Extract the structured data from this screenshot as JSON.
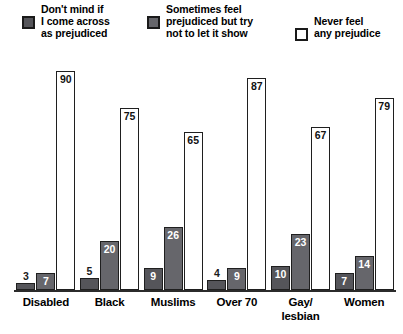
{
  "chart_data": {
    "type": "bar",
    "title": "",
    "subtitle": "",
    "xlabel": "",
    "ylabel": "",
    "ylim": [
      0,
      95
    ],
    "grid": false,
    "legend_position": "top",
    "categories": [
      "Disabled",
      "Black",
      "Muslims",
      "Over 70",
      "Gay/\nlesbian",
      "Women"
    ],
    "series": [
      {
        "name": "Don't mind if\nI come across\nas prejudiced",
        "color": "#55555a",
        "values": [
          3,
          5,
          9,
          4,
          10,
          7
        ]
      },
      {
        "name": "Sometimes feel\nprejudiced but try\nnot to let it show",
        "color": "#66666b",
        "values": [
          7,
          20,
          26,
          9,
          23,
          14
        ]
      },
      {
        "name": "Never feel\nany prejudice",
        "color": "#ffffff",
        "values": [
          90,
          75,
          65,
          87,
          67,
          79
        ]
      }
    ]
  },
  "legend": {
    "entries": [
      {
        "label": "Don't mind if\nI come across\nas prejudiced",
        "swatch": "#55555a"
      },
      {
        "label": "Sometimes feel\nprejudiced but try\nnot to let it show",
        "swatch": "#66666b"
      },
      {
        "label": "Never feel\nany prejudice",
        "swatch": "#ffffff"
      }
    ]
  },
  "axis": {
    "baseline_color": "#2b2b2b"
  }
}
